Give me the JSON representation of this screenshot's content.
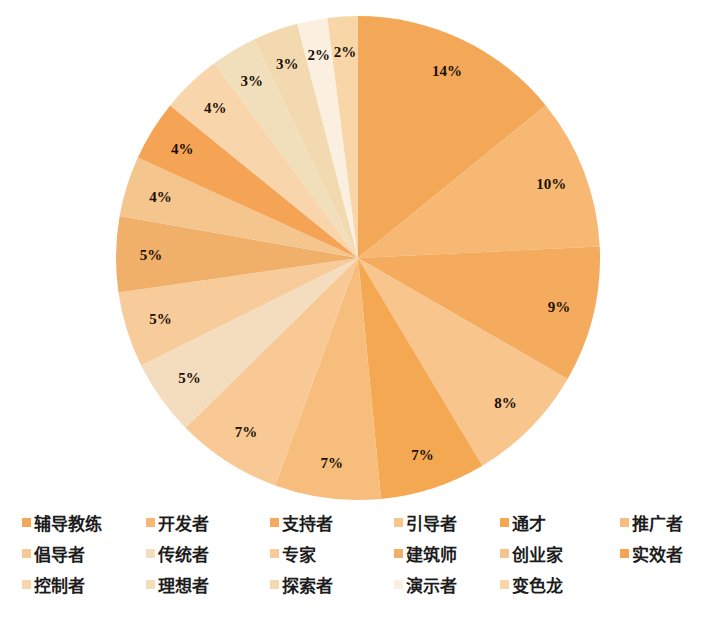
{
  "chart_data": {
    "type": "pie",
    "title": "",
    "subtitle": "",
    "xlabel": "",
    "ylabel": "",
    "legend_position": "bottom",
    "grid": false,
    "start_angle_deg": 0,
    "direction": "clockwise",
    "labels_format": "percent",
    "categories": [
      "辅导教练",
      "开发者",
      "支持者",
      "引导者",
      "通才",
      "推广者",
      "倡导者",
      "传统者",
      "专家",
      "建筑师",
      "创业家",
      "实效者",
      "控制者",
      "理想者",
      "探索者",
      "演示者",
      "变色龙"
    ],
    "values": [
      14,
      10,
      9,
      8,
      7,
      7,
      7,
      5,
      5,
      5,
      4,
      4,
      4,
      3,
      3,
      2,
      2
    ],
    "value_labels": [
      "14%",
      "10%",
      "9%",
      "8%",
      "7%",
      "7%",
      "7%",
      "5%",
      "5%",
      "5%",
      "4%",
      "4%",
      "4%",
      "3%",
      "3%",
      "2%",
      "2%"
    ],
    "colors": [
      "#f3a857",
      "#f6b873",
      "#f5ab5e",
      "#f8c58c",
      "#f5a852",
      "#f7bd7c",
      "#f8c994",
      "#f3ddbe",
      "#f8cb9a",
      "#f0b06a",
      "#f5c58e",
      "#f5a455",
      "#f9d5ab",
      "#f1deba",
      "#f3d9b0",
      "#fbf0e0",
      "#f9d6a8"
    ]
  },
  "legend": {
    "rows": [
      [
        {
          "label": "辅导教练",
          "color": "#f3a857"
        },
        {
          "label": "开发者",
          "color": "#f6b873"
        },
        {
          "label": "支持者",
          "color": "#f5ab5e"
        },
        {
          "label": "引导者",
          "color": "#f8c58c"
        },
        {
          "label": "通才",
          "color": "#f5a852"
        },
        {
          "label": "推广者",
          "color": "#f7bd7c"
        }
      ],
      [
        {
          "label": "倡导者",
          "color": "#f8c994"
        },
        {
          "label": "传统者",
          "color": "#f3ddbe"
        },
        {
          "label": "专家",
          "color": "#f8cb9a"
        },
        {
          "label": "建筑师",
          "color": "#f0b06a"
        },
        {
          "label": "创业家",
          "color": "#f5c58e"
        },
        {
          "label": "实效者",
          "color": "#f5a455"
        }
      ],
      [
        {
          "label": "控制者",
          "color": "#f9d5ab"
        },
        {
          "label": "理想者",
          "color": "#f1deba"
        },
        {
          "label": "探索者",
          "color": "#f3d9b0"
        },
        {
          "label": "演示者",
          "color": "#fbf0e0"
        },
        {
          "label": "变色龙",
          "color": "#f9d6a8"
        }
      ]
    ],
    "column_x": [
      22,
      146,
      270,
      394,
      500,
      620
    ],
    "column_x_row3": [
      22,
      146,
      270,
      394,
      500
    ]
  },
  "pie_geometry": {
    "cx": 358,
    "cy": 258,
    "r": 242,
    "label_radius_ratio": 0.855
  }
}
